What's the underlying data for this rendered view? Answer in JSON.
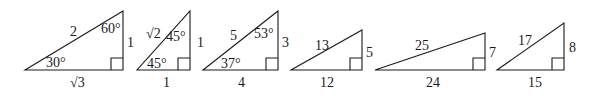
{
  "figure": {
    "stroke_color": "#1a1a1a",
    "background": "#ffffff"
  },
  "triangles": [
    {
      "id": "t1",
      "points": [
        [
          25,
          70
        ],
        [
          123,
          70
        ],
        [
          123,
          11
        ]
      ],
      "right_angle": [
        123,
        70
      ],
      "labels": {
        "hypotenuse": {
          "text": "2",
          "x": 70,
          "y": 36
        },
        "vertical": {
          "text": "1",
          "x": 127,
          "y": 47
        },
        "base": {
          "text": "√3",
          "x": 70,
          "y": 87
        },
        "angle_top": {
          "text": "60°",
          "x": 101,
          "y": 33
        },
        "angle_left": {
          "text": "30°",
          "x": 46,
          "y": 67
        }
      }
    },
    {
      "id": "t2",
      "points": [
        [
          137,
          70
        ],
        [
          190,
          70
        ],
        [
          190,
          11
        ]
      ],
      "right_angle": [
        190,
        70
      ],
      "labels": {
        "hypotenuse": {
          "text": "√2",
          "x": 146,
          "y": 38
        },
        "vertical": {
          "text": "1",
          "x": 197,
          "y": 47
        },
        "base": {
          "text": "1",
          "x": 163,
          "y": 87
        },
        "angle_top": {
          "text": "45°",
          "x": 166,
          "y": 41
        },
        "angle_left": {
          "text": "45°",
          "x": 147,
          "y": 68
        }
      }
    },
    {
      "id": "t3",
      "points": [
        [
          203,
          70
        ],
        [
          278,
          70
        ],
        [
          278,
          11
        ]
      ],
      "right_angle": [
        278,
        70
      ],
      "labels": {
        "hypotenuse": {
          "text": "5",
          "x": 230,
          "y": 40
        },
        "vertical": {
          "text": "3",
          "x": 282,
          "y": 47
        },
        "base": {
          "text": "4",
          "x": 238,
          "y": 87
        },
        "angle_top": {
          "text": "53°",
          "x": 254,
          "y": 38
        },
        "angle_left": {
          "text": "37°",
          "x": 221,
          "y": 68
        }
      }
    },
    {
      "id": "t4",
      "points": [
        [
          291,
          70
        ],
        [
          362,
          70
        ],
        [
          362,
          30
        ]
      ],
      "right_angle": [
        362,
        70
      ],
      "labels": {
        "hypotenuse": {
          "text": "13",
          "x": 315,
          "y": 50
        },
        "vertical": {
          "text": "5",
          "x": 366,
          "y": 57
        },
        "base": {
          "text": "12",
          "x": 320,
          "y": 87
        }
      }
    },
    {
      "id": "t5",
      "points": [
        [
          375,
          70
        ],
        [
          485,
          70
        ],
        [
          485,
          33
        ]
      ],
      "right_angle": [
        485,
        70
      ],
      "labels": {
        "hypotenuse": {
          "text": "25",
          "x": 415,
          "y": 50
        },
        "vertical": {
          "text": "7",
          "x": 489,
          "y": 57
        },
        "base": {
          "text": "24",
          "x": 426,
          "y": 87
        }
      }
    },
    {
      "id": "t6",
      "points": [
        [
          497,
          70
        ],
        [
          564,
          70
        ],
        [
          564,
          23
        ]
      ],
      "right_angle": [
        564,
        70
      ],
      "labels": {
        "hypotenuse": {
          "text": "17",
          "x": 518,
          "y": 45
        },
        "vertical": {
          "text": "8",
          "x": 569,
          "y": 52
        },
        "base": {
          "text": "15",
          "x": 528,
          "y": 87
        }
      }
    }
  ],
  "right_angle_box_size": 12
}
